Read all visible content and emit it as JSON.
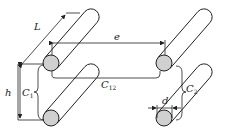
{
  "diagram": {
    "colors": {
      "stroke": "#222222",
      "fill_end": "#d0d0d0",
      "background": "#ffffff"
    },
    "labels": {
      "L": {
        "main": "L",
        "sub": ""
      },
      "e": {
        "main": "e",
        "sub": ""
      },
      "h": {
        "main": "h",
        "sub": ""
      },
      "C1": {
        "main": "C",
        "sub": "1"
      },
      "C12": {
        "main": "C",
        "sub": "12"
      },
      "C2": {
        "main": "C",
        "sub": "2"
      },
      "d": {
        "main": "d",
        "sub": ""
      }
    },
    "cylinders": [
      {
        "id": "top-left"
      },
      {
        "id": "bottom-left"
      },
      {
        "id": "top-right"
      },
      {
        "id": "bottom-right"
      }
    ]
  }
}
